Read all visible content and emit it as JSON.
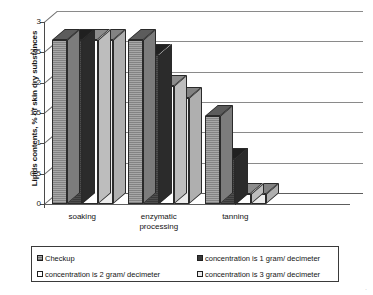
{
  "chart_data": {
    "type": "bar",
    "title": "",
    "xlabel": "",
    "ylabel": "Lipids contents, % of skin dry substances",
    "categories": [
      "soaking",
      "enzymatic processing",
      "tanning"
    ],
    "category_lines": [
      [
        "soaking"
      ],
      [
        "enzymatic",
        "processing"
      ],
      [
        "tanning"
      ]
    ],
    "ylim": [
      0,
      3
    ],
    "ytick_values": [
      0,
      0.5,
      1,
      1.5,
      2,
      2.5,
      3
    ],
    "ytick_labels": [
      "0",
      "0,5",
      "1",
      "1,5",
      "2",
      "2,5",
      "3"
    ],
    "grid": true,
    "legend_position": "bottom",
    "three_d": true,
    "series": [
      {
        "name": "Checkup",
        "color": "#a8a8a8",
        "values": [
          2.7,
          2.7,
          1.45
        ]
      },
      {
        "name": "concentration is 1 gram/ decimeter",
        "color": "#3a3a3a",
        "values": [
          2.7,
          2.45,
          0.75
        ]
      },
      {
        "name": "concentration   is 2 gram/ decimeter",
        "color": "#ffffff",
        "values": [
          2.7,
          1.95,
          0.17
        ]
      },
      {
        "name": "concentration   is 3 gram/ decimeter",
        "color": "#ececec",
        "values": [
          2.7,
          1.75,
          0.17
        ]
      }
    ]
  },
  "legend": {
    "entries": [
      {
        "label": "Checkup",
        "color": "#a8a8a8"
      },
      {
        "label": "concentration is 1 gram/ decimeter",
        "color": "#3a3a3a"
      },
      {
        "label": "concentration   is 2 gram/ decimeter",
        "color": "#ffffff"
      },
      {
        "label": "concentration   is 3 gram/ decimeter",
        "color": "#ececec"
      }
    ]
  },
  "artifacts": {
    "corner_speck": "·"
  }
}
